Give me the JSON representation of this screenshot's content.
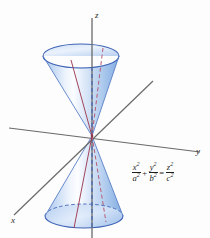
{
  "figure": {
    "background_color": "#fdfdfd"
  },
  "axes": {
    "z": {
      "label": "z",
      "color": "#555555"
    },
    "y": {
      "label": "y",
      "color": "#555555"
    },
    "x": {
      "label": "x",
      "color": "#555555"
    }
  },
  "equation": {
    "x_num": "x",
    "x_den": "a",
    "plus": "+",
    "y_num": "y",
    "y_den": "b",
    "equals": "=",
    "z_num": "z",
    "z_den": "c",
    "exp": "2",
    "full_text": "x^2/a^2 + y^2/b^2 = z^2/c^2"
  },
  "surface": {
    "fill_light": "#f4f8fd",
    "fill_mid": "#c5d8f2",
    "fill_deep": "#8fb2e4",
    "rim_color": "#3f63b5",
    "ruling_solid_color": "#9e3b52",
    "ruling_dashed_color": "#b4566b",
    "axis_dash_color": "#3f63b5"
  },
  "geometry": {
    "apex_x": 92,
    "apex_y": 136,
    "top_ellipse_cx": 81,
    "top_ellipse_cy": 56,
    "top_ellipse_rx": 38,
    "top_ellipse_ry": 12,
    "bottom_ellipse_cx": 84,
    "bottom_ellipse_cy": 216,
    "bottom_ellipse_rx": 39,
    "bottom_ellipse_ry": 12
  }
}
